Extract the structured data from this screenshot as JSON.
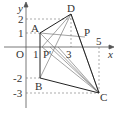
{
  "diagram": {
    "axes": {
      "x_label": "x",
      "y_label": "y",
      "origin_label": "O"
    },
    "ticks": {
      "x": [
        "1",
        "3",
        "5"
      ],
      "y": [
        "1",
        "2",
        "-2",
        "-3"
      ]
    },
    "points": [
      {
        "name": "A",
        "coords": [
          1,
          1
        ]
      },
      {
        "name": "B",
        "coords": [
          1,
          -2
        ]
      },
      {
        "name": "C",
        "coords": [
          5,
          -3
        ]
      },
      {
        "name": "D",
        "coords": [
          3,
          2
        ]
      },
      {
        "name": "P",
        "coords": [
          4,
          1
        ]
      },
      {
        "name": "P'",
        "coords": [
          1.3,
          0
        ]
      }
    ],
    "labels": {
      "A": "A",
      "B": "B",
      "C": "C",
      "D": "D",
      "P": "P",
      "Pp": "P'"
    }
  }
}
